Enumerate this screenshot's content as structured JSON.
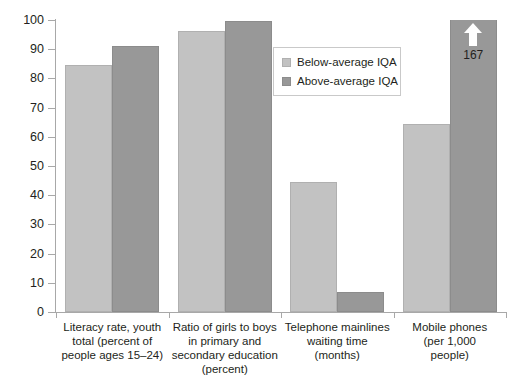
{
  "chart_data": {
    "type": "bar",
    "title": "",
    "subtitle": "",
    "xlabel": "",
    "ylabel": "",
    "ylim": [
      0,
      100
    ],
    "yticks": [
      0,
      10,
      20,
      30,
      40,
      50,
      60,
      70,
      80,
      90,
      100
    ],
    "grid": false,
    "legend_position": "upper-center",
    "categories": [
      "Literacy rate, youth total (percent of people ages 15–24)",
      "Ratio of girls to boys in primary and secondary education (percent)",
      "Telephone mainlines waiting time (months)",
      "Mobile phones (per 1,000 people)"
    ],
    "category_lines": [
      [
        "Literacy rate, youth",
        "total (percent of",
        "people ages 15–24)"
      ],
      [
        "Ratio of girls to boys",
        "in primary and",
        "secondary education",
        "(percent)"
      ],
      [
        "Telephone mainlines",
        "waiting time",
        "(months)"
      ],
      [
        "Mobile phones",
        "(per 1,000",
        "people)"
      ]
    ],
    "series": [
      {
        "name": "Below-average IQA",
        "color": "#c2c2c2",
        "values": [
          84.6,
          96.2,
          44.5,
          64.4
        ]
      },
      {
        "name": "Above-average IQA",
        "color": "#989898",
        "values": [
          91.1,
          99.7,
          6.9,
          167
        ]
      }
    ],
    "annotations": [
      {
        "type": "overflow-arrow",
        "series": "Above-average IQA",
        "category_index": 3,
        "value": 167,
        "label": "167"
      }
    ]
  },
  "legend": {
    "items": [
      {
        "label": "Below-average IQA",
        "swatch": "light"
      },
      {
        "label": "Above-average IQA",
        "swatch": "dark"
      }
    ]
  },
  "axis": {
    "y_labels": [
      "100",
      "90",
      "80",
      "70",
      "60",
      "50",
      "40",
      "30",
      "20",
      "10",
      "0"
    ]
  }
}
